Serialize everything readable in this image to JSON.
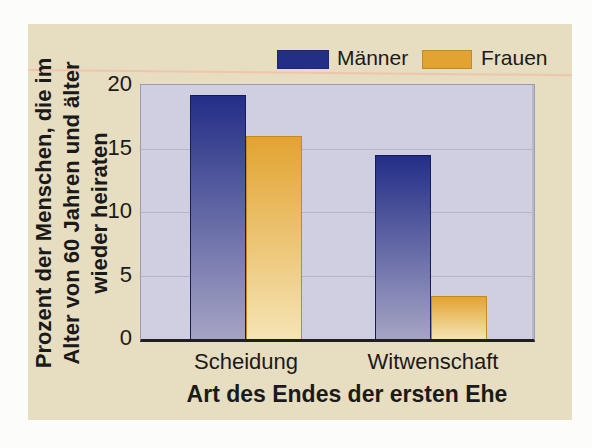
{
  "chart_data": {
    "type": "bar",
    "categories": [
      "Scheidung",
      "Witwenschaft"
    ],
    "series": [
      {
        "name": "Männer",
        "values": [
          19.2,
          14.5
        ],
        "color_top": "#232e87",
        "color_bottom": "#a5a4c4",
        "outline": "#161d55"
      },
      {
        "name": "Frauen",
        "values": [
          16.0,
          3.4
        ],
        "color_top": "#e3a331",
        "color_bottom": "#f5e4b4",
        "outline": "#c28b1e"
      }
    ],
    "title": "",
    "xlabel": "Art des Endes der ersten Ehe",
    "ylabel": "Prozent der Menschen, die im\nAlter von 60 Jahren und älter\nwieder heiraten",
    "ylim": [
      0,
      20
    ],
    "yticks": [
      0,
      5,
      10,
      15,
      20
    ],
    "grid": true,
    "legend_position": "top"
  },
  "colors": {
    "page_background": "#fcfcfa",
    "card_background": "#e7ddc1",
    "rule": "#f2c4aa",
    "plot_background": "#cfcfe1",
    "gridline": "#b6b6c8",
    "axis_line": "#1f1f1f",
    "text": "#1a1a1a"
  }
}
